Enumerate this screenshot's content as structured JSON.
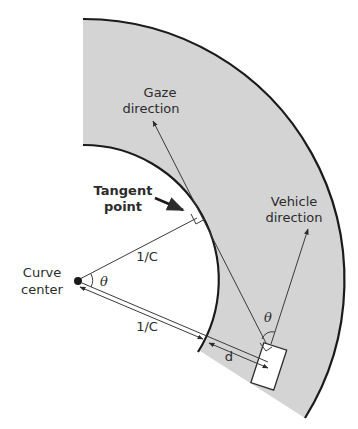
{
  "figure": {
    "colors": {
      "road_fill": "#d4d4d4",
      "edge_line": "#1a1a1a",
      "thin_line": "#3a3a3a",
      "vehicle_fill": "#ffffff",
      "text": "#2b2b2b"
    },
    "labels": {
      "gaze_line1": "Gaze",
      "gaze_line2": "direction",
      "vehicle_line1": "Vehicle",
      "vehicle_line2": "direction",
      "tangent_line1": "Tangent",
      "tangent_line2": "point",
      "center_line1": "Curve",
      "center_line2": "center",
      "radius_upper": "1/C",
      "radius_lower": "1/C",
      "distance": "d",
      "angle_center": "θ",
      "angle_vehicle": "θ"
    },
    "elements": [
      "road-band",
      "inner-edge",
      "outer-edge",
      "curve-center-dot",
      "radius-to-tangent-point",
      "radius-to-vehicle-double-arrow",
      "distance-d-arrow",
      "gaze-direction-arrow",
      "vehicle-direction-arrow",
      "vehicle-rectangle",
      "tangent-point-pointer-arrow",
      "right-angle-marks",
      "angle-arcs"
    ]
  }
}
